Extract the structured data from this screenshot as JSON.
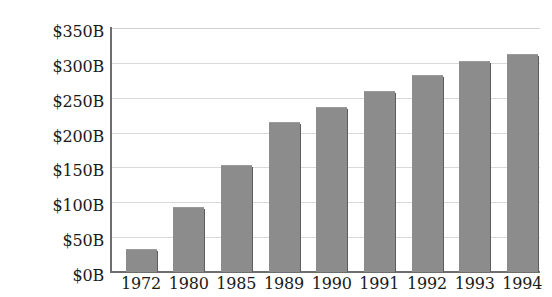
{
  "chart_data": {
    "type": "bar",
    "title": "",
    "subtitle": "",
    "xlabel": "",
    "ylabel": "",
    "categories": [
      "1972",
      "1980",
      "1985",
      "1989",
      "1990",
      "1991",
      "1992",
      "1993",
      "1994"
    ],
    "values": [
      33,
      93,
      153,
      215,
      236,
      259,
      283,
      303,
      313
    ],
    "value_unit": "billions of dollars",
    "ylim": [
      0,
      350
    ],
    "ytick_values": [
      0,
      50,
      100,
      150,
      200,
      250,
      300,
      350
    ],
    "ytick_labels": [
      "$0B",
      "$50B",
      "$100B",
      "$150B",
      "$200B",
      "$250B",
      "$300B",
      "$350B"
    ],
    "grid": true,
    "grid_axis": "y",
    "legend": false,
    "legend_position": "none",
    "series": [
      {
        "name": "",
        "values": [
          33,
          93,
          153,
          215,
          236,
          259,
          283,
          303,
          313
        ]
      }
    ],
    "colors": {
      "bar_fill": "#8c8c8c",
      "bar_shadow": "#5d5d5d",
      "gridline": "#d9d9d9",
      "axis_line": "#6e6e6e",
      "text": "#1a1a1a",
      "background": "#ffffff",
      "page_edge": "#3a3a3a"
    }
  }
}
